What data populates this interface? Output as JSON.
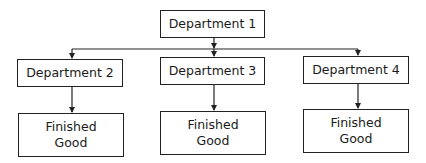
{
  "diagram": {
    "type": "org-flow",
    "root": {
      "id": "dept1",
      "label": "Department 1"
    },
    "departments": [
      {
        "id": "dept2",
        "label": "Department 2"
      },
      {
        "id": "dept3",
        "label": "Department 3"
      },
      {
        "id": "dept4",
        "label": "Department 4"
      }
    ],
    "outputs": [
      {
        "id": "fg1",
        "line1": "Finished",
        "line2": "Good",
        "from": "dept2"
      },
      {
        "id": "fg2",
        "line1": "Finished",
        "line2": "Good",
        "from": "dept3"
      },
      {
        "id": "fg3",
        "line1": "Finished",
        "line2": "Good",
        "from": "dept4"
      }
    ],
    "edges": [
      [
        "dept1",
        "dept2"
      ],
      [
        "dept1",
        "dept3"
      ],
      [
        "dept1",
        "dept4"
      ],
      [
        "dept2",
        "fg1"
      ],
      [
        "dept3",
        "fg2"
      ],
      [
        "dept4",
        "fg3"
      ]
    ],
    "colors": {
      "line": "#222222",
      "background": "#ffffff",
      "text": "#1a1a1a"
    }
  }
}
